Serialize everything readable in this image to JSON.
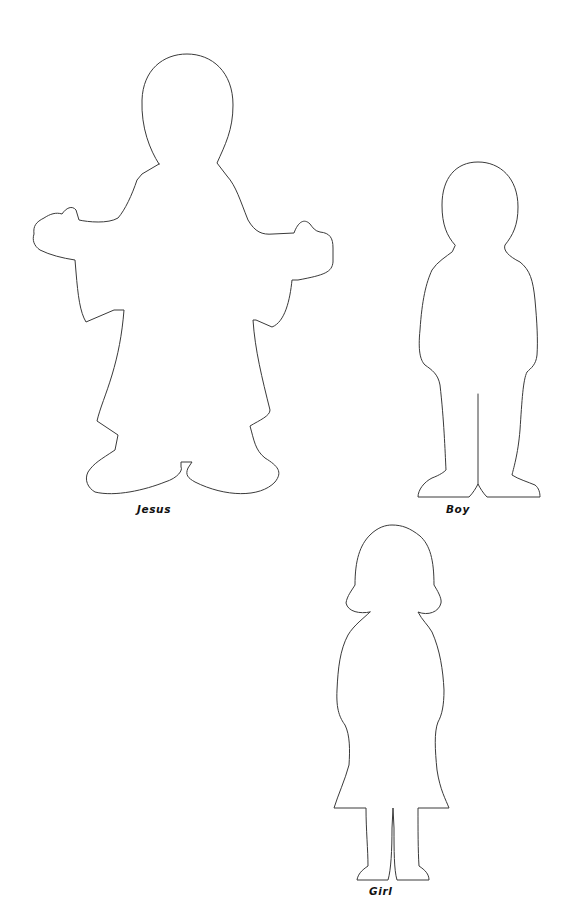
{
  "page": {
    "background": "#ffffff",
    "outline_color": "#3a3a3a"
  },
  "figures": [
    {
      "id": "jesus",
      "label": "Jesus"
    },
    {
      "id": "boy",
      "label": "Boy"
    },
    {
      "id": "girl",
      "label": "Girl"
    }
  ]
}
